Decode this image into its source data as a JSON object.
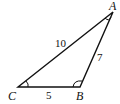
{
  "diagram": {
    "type": "triangle",
    "vertices": [
      {
        "name": "A",
        "x": 113,
        "y": 12
      },
      {
        "name": "B",
        "x": 80,
        "y": 87
      },
      {
        "name": "C",
        "x": 18,
        "y": 87
      }
    ],
    "sides": [
      {
        "between": "CA",
        "length": "10"
      },
      {
        "between": "AB",
        "length": "7"
      },
      {
        "between": "CB",
        "length": "5"
      }
    ],
    "angle_marks": [
      "A",
      "B",
      "C"
    ],
    "stroke_color": "#111111"
  }
}
